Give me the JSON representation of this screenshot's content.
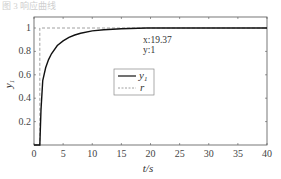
{
  "header": {
    "faded_title": "图 3 响应曲线"
  },
  "chart_data": {
    "type": "line",
    "title": "",
    "xlabel": "t/s",
    "ylabel": "y1",
    "xlim": [
      0,
      40
    ],
    "ylim": [
      0,
      1.1
    ],
    "xticks": [
      0,
      5,
      10,
      15,
      20,
      25,
      30,
      35,
      40
    ],
    "yticks": [
      0.2,
      0.4,
      0.6,
      0.8,
      1
    ],
    "grid": false,
    "legend_position": "inside-center",
    "series": [
      {
        "name": "y1",
        "style": "solid",
        "color": "#111111",
        "x": [
          0,
          1,
          1.2,
          1.5,
          2,
          2.5,
          3,
          4,
          5,
          6,
          7,
          8,
          10,
          12,
          15,
          19.37,
          25,
          30,
          40
        ],
        "y": [
          0,
          0,
          0.3,
          0.55,
          0.66,
          0.73,
          0.78,
          0.85,
          0.89,
          0.92,
          0.94,
          0.955,
          0.975,
          0.985,
          0.993,
          1,
          1,
          1,
          1
        ]
      },
      {
        "name": "r",
        "style": "dashed",
        "color": "#888888",
        "x": [
          0,
          1,
          1,
          40
        ],
        "y": [
          0,
          0,
          1,
          1
        ]
      }
    ],
    "annotations": [
      {
        "text_x": "x:19.37",
        "text_y": "y:1",
        "x": 19.37,
        "y": 1
      }
    ]
  },
  "legend": {
    "items": [
      {
        "label": "y",
        "sub": "1"
      },
      {
        "label": "r",
        "sub": ""
      }
    ]
  }
}
